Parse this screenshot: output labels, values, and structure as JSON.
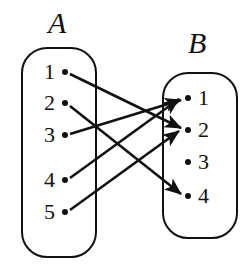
{
  "diagram": {
    "title": "",
    "type": "function-mapping-diagram",
    "stroke_color": "#111111",
    "background_color": "#ffffff"
  },
  "sets": {
    "left": {
      "label": "A",
      "box": {
        "x": 21,
        "y": 47,
        "width": 76,
        "height": 211,
        "radius": 26
      },
      "label_position": {
        "x": 48,
        "y": 8
      },
      "elements": [
        {
          "id": "a1",
          "label": "1",
          "x": 65,
          "y": 72
        },
        {
          "id": "a2",
          "label": "2",
          "x": 65,
          "y": 103
        },
        {
          "id": "a3",
          "label": "3",
          "x": 65,
          "y": 135
        },
        {
          "id": "a4",
          "label": "4",
          "x": 65,
          "y": 180
        },
        {
          "id": "a5",
          "label": "5",
          "x": 65,
          "y": 212
        }
      ]
    },
    "right": {
      "label": "B",
      "box": {
        "x": 162,
        "y": 72,
        "width": 76,
        "height": 167,
        "radius": 26
      },
      "label_position": {
        "x": 188,
        "y": 28
      },
      "elements": [
        {
          "id": "b1",
          "label": "1",
          "x": 188,
          "y": 98
        },
        {
          "id": "b2",
          "label": "2",
          "x": 188,
          "y": 130
        },
        {
          "id": "b3",
          "label": "3",
          "x": 188,
          "y": 162
        },
        {
          "id": "b4",
          "label": "4",
          "x": 188,
          "y": 196
        }
      ]
    }
  },
  "arrows": [
    {
      "from": "a1",
      "to": "b2",
      "x1": 70,
      "y1": 74,
      "x2": 181,
      "y2": 128
    },
    {
      "from": "a2",
      "to": "b4",
      "x1": 70,
      "y1": 106,
      "x2": 181,
      "y2": 194
    },
    {
      "from": "a3",
      "to": "b1",
      "x1": 70,
      "y1": 134,
      "x2": 181,
      "y2": 100
    },
    {
      "from": "a4",
      "to": "b1",
      "x1": 70,
      "y1": 178,
      "x2": 179,
      "y2": 99
    },
    {
      "from": "a5",
      "to": "b2",
      "x1": 70,
      "y1": 210,
      "x2": 179,
      "y2": 131
    }
  ]
}
